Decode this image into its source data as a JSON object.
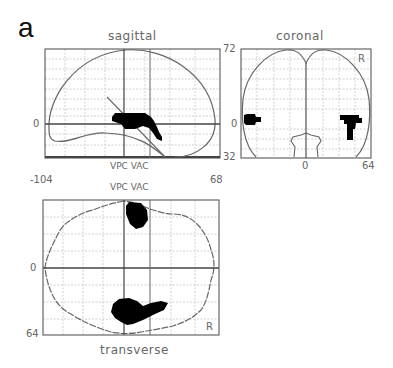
{
  "figure": {
    "panel_label": "a",
    "colors": {
      "outline": "#666666",
      "grid": "#bbbbbb",
      "activation": "#000000",
      "axis": "#444444"
    }
  },
  "sagittal": {
    "title": "sagittal",
    "y_zero_label": "0",
    "x_min_label": "-104",
    "x_max_label": "68",
    "landmark_label": "VPC VAC"
  },
  "coronal": {
    "title": "coronal",
    "y_max_label": "72",
    "y_zero_label": "0",
    "y_min_label": "32",
    "x_zero_label": "0",
    "x_max_label": "64",
    "side_label": "R"
  },
  "transverse": {
    "title": "transverse",
    "landmark_label": "VPC VAC",
    "y_zero_label": "0",
    "y_max_label": "64",
    "side_label": "R"
  }
}
